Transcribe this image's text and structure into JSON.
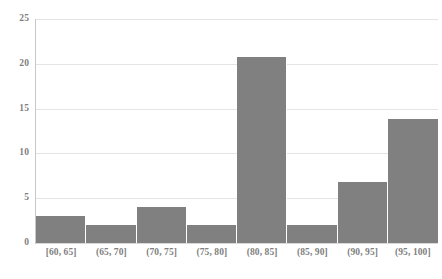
{
  "chart_data": {
    "type": "bar",
    "title": "",
    "subtitle": "",
    "xlabel": "",
    "ylabel": "",
    "categories": [
      "[60, 65]",
      "(65, 70]",
      "(70, 75]",
      "(75, 80]",
      "(80, 85]",
      "(85, 90]",
      "(90, 95]",
      "(95, 100]"
    ],
    "values": [
      3,
      2,
      4,
      2,
      20.8,
      2,
      6.8,
      13.8
    ],
    "ylim": [
      0,
      25
    ],
    "yticks": [
      0,
      5,
      10,
      15,
      20,
      25
    ],
    "ytick_labels": [
      "0",
      "5",
      "10",
      "15",
      "20",
      "25"
    ],
    "grid": true,
    "grid_axis": "y",
    "legend": false,
    "legend_position": "none",
    "annotations": []
  },
  "style": {
    "bar_color": "#808080",
    "gridline_color": "#e4e4e4",
    "axis_line_color": "#c8c8c8",
    "label_color": "#808080",
    "background_color": "#ffffff"
  }
}
